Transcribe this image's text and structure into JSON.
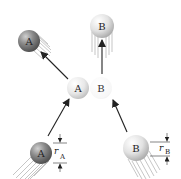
{
  "diagram": {
    "balls": [
      {
        "id": "A_before",
        "label": "A",
        "cx": 42,
        "cy": 153,
        "r": 11,
        "shade": "dark"
      },
      {
        "id": "B_before",
        "label": "B",
        "cx": 136,
        "cy": 148,
        "r": 13,
        "shade": "light"
      },
      {
        "id": "A_impact",
        "label": "A",
        "cx": 78,
        "cy": 88,
        "r": 11,
        "shade": "light-gray"
      },
      {
        "id": "B_impact",
        "label": "B",
        "cx": 104,
        "cy": 88,
        "r": 12,
        "shade": "faint"
      },
      {
        "id": "A_after",
        "label": "A",
        "cx": 29,
        "cy": 41,
        "r": 11,
        "shade": "dark"
      },
      {
        "id": "B_after",
        "label": "B",
        "cx": 102,
        "cy": 26,
        "r": 12,
        "shade": "light"
      }
    ],
    "arrows": [
      {
        "from": "A_before",
        "to": "A_impact"
      },
      {
        "from": "B_before",
        "to": "B_impact"
      },
      {
        "from": "A_impact",
        "to": "A_after"
      },
      {
        "from": "B_impact",
        "to": "B_after"
      }
    ],
    "dimensions": [
      {
        "label_main": "r",
        "label_sub": "A",
        "target": "A_before"
      },
      {
        "label_main": "r",
        "label_sub": "B",
        "target": "B_before"
      }
    ],
    "colors": {
      "dark_ball": "#6e6e6e",
      "light_ball": "#d9d9d9",
      "arrow": "#222222",
      "motion_lines": "#9a9a9a"
    }
  }
}
